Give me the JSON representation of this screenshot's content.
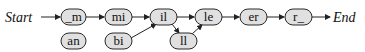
{
  "diagram": {
    "start_label": "Start",
    "end_label": "End",
    "nodes": [
      {
        "id": "m",
        "label": "_m"
      },
      {
        "id": "an",
        "label": "an"
      },
      {
        "id": "mi",
        "label": "mi"
      },
      {
        "id": "bi",
        "label": "bi"
      },
      {
        "id": "il",
        "label": "il"
      },
      {
        "id": "ll",
        "label": "ll"
      },
      {
        "id": "le",
        "label": "le"
      },
      {
        "id": "er",
        "label": "er"
      },
      {
        "id": "r",
        "label": "r_"
      }
    ],
    "edges": [
      [
        "Start",
        "_m"
      ],
      [
        "_m",
        "mi"
      ],
      [
        "mi",
        "il"
      ],
      [
        "bi",
        "il"
      ],
      [
        "il",
        "le"
      ],
      [
        "il",
        "ll"
      ],
      [
        "ll",
        "le"
      ],
      [
        "le",
        "er"
      ],
      [
        "er",
        "r_"
      ],
      [
        "r_",
        "End"
      ]
    ],
    "colors": {
      "node_fill": "#e0e0e0",
      "stroke": "#2a2a2a"
    }
  }
}
